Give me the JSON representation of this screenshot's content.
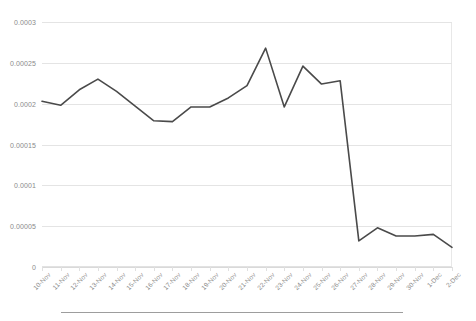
{
  "chart_data": {
    "type": "line",
    "title": "",
    "subtitle": "",
    "xlabel": "",
    "ylabel": "",
    "categories": [
      "10-Nov",
      "11-Nov",
      "12-Nov",
      "13-Nov",
      "14-Nov",
      "15-Nov",
      "16-Nov",
      "17-Nov",
      "18-Nov",
      "19-Nov",
      "20-Nov",
      "21-Nov",
      "22-Nov",
      "23-Nov",
      "24-Nov",
      "25-Nov",
      "26-Nov",
      "27-Nov",
      "28-Nov",
      "29-Nov",
      "30-Nov",
      "1-Dec",
      "2-Dec"
    ],
    "values": [
      0.000203,
      0.000198,
      0.000217,
      0.00023,
      0.000215,
      0.000197,
      0.000179,
      0.000178,
      0.000196,
      0.000196,
      0.000207,
      0.000222,
      0.000268,
      0.000196,
      0.000246,
      0.000224,
      0.000228,
      3.2e-05,
      4.8e-05,
      3.8e-05,
      3.8e-05,
      4e-05,
      2.4e-05
    ],
    "ylim": [
      0,
      0.0003
    ],
    "ytick_labels": [
      "0",
      "0.00005",
      "0.0001",
      "0.00015",
      "0.0002",
      "0.00025",
      "0.0003"
    ],
    "ytick_values": [
      0,
      5e-05,
      0.0001,
      0.00015,
      0.0002,
      0.00025,
      0.0003
    ],
    "grid": "horizontal",
    "legend": "none",
    "series": [
      {
        "name": "series-1",
        "color": "#4a4a4a",
        "values": [
          0.000203,
          0.000198,
          0.000217,
          0.00023,
          0.000215,
          0.000197,
          0.000179,
          0.000178,
          0.000196,
          0.000196,
          0.000207,
          0.000222,
          0.000268,
          0.000196,
          0.000246,
          0.000224,
          0.000228,
          3.2e-05,
          4.8e-05,
          3.8e-05,
          3.8e-05,
          4e-05,
          2.4e-05
        ]
      }
    ]
  },
  "style": {
    "line_color": "#4a4a4a",
    "gridline_color": "#e4e4e4",
    "axis_label_color": "#8a8a8a",
    "background_color": "#ffffff",
    "divider_color": "#9d9d9d"
  }
}
